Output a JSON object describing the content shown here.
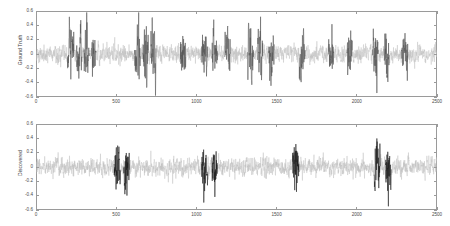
{
  "figure": {
    "background_color": "#ffffff",
    "axis_color": "#9a9a9a",
    "noise_color": "#bfbfbf",
    "highlight_color_top": "#555555",
    "highlight_color_bottom": "#1a1a1a"
  },
  "chart_data": [
    {
      "type": "line",
      "title": "",
      "subplot_index": 0,
      "xlabel": "",
      "ylabel": "Ground Truth",
      "xlim": [
        0,
        2500
      ],
      "ylim": [
        -0.6,
        0.6
      ],
      "grid": false,
      "legend": null,
      "xticks": [
        0,
        500,
        1000,
        1500,
        2000,
        2500
      ],
      "xticklabels": [
        "0",
        "500",
        "1000",
        "1500",
        "2000",
        "2500"
      ],
      "yticks": [
        -0.6,
        -0.4,
        -0.2,
        0,
        0.2,
        0.4,
        0.6
      ],
      "yticklabels": [
        "-0.6",
        "-0.4",
        "-0.2",
        "0",
        "0.2",
        "0.4",
        "0.6"
      ],
      "series": [
        {
          "name": "background noise",
          "color": "#bfbfbf",
          "description": "Light gray dense zero-mean noisy signal spanning the full x range, amplitude roughly +/-0.25",
          "noise_amplitude": 0.22,
          "n_points": 2500,
          "seed": 1337
        },
        {
          "name": "highlighted bursts",
          "color": "#555555",
          "description": "Dark gray high-amplitude burst segments overlaid on the noise, amplitude roughly +/-0.5",
          "burst_amplitude": 0.5,
          "bursts": [
            [
              196,
              238
            ],
            [
              252,
              286
            ],
            [
              300,
              332
            ],
            [
              346,
              374
            ],
            [
              614,
              652
            ],
            [
              666,
              700
            ],
            [
              716,
              748
            ],
            [
              900,
              934
            ],
            [
              1034,
              1070
            ],
            [
              1098,
              1132
            ],
            [
              1178,
              1212
            ],
            [
              1320,
              1356
            ],
            [
              1382,
              1414
            ],
            [
              1452,
              1486
            ],
            [
              1642,
              1678
            ],
            [
              1824,
              1856
            ],
            [
              1940,
              1972
            ],
            [
              2100,
              2134
            ],
            [
              2170,
              2202
            ],
            [
              2280,
              2318
            ]
          ]
        }
      ]
    },
    {
      "type": "line",
      "title": "",
      "subplot_index": 1,
      "xlabel": "",
      "ylabel": "Discovered",
      "xlim": [
        0,
        2500
      ],
      "ylim": [
        -0.6,
        0.6
      ],
      "grid": false,
      "legend": null,
      "xticks": [
        0,
        500,
        1000,
        1500,
        2000,
        2500
      ],
      "xticklabels": [
        "0",
        "500",
        "1000",
        "1500",
        "2000",
        "2500"
      ],
      "yticks": [
        -0.6,
        -0.4,
        -0.2,
        0,
        0.2,
        0.4,
        0.6
      ],
      "yticklabels": [
        "-0.6",
        "-0.4",
        "-0.2",
        "0",
        "0.2",
        "0.4",
        "0.6"
      ],
      "series": [
        {
          "name": "background noise",
          "color": "#bfbfbf",
          "description": "Light gray dense zero-mean noisy signal spanning the full x range, amplitude roughly +/-0.25",
          "noise_amplitude": 0.22,
          "n_points": 2500,
          "seed": 24601
        },
        {
          "name": "highlighted bursts",
          "color": "#1a1a1a",
          "description": "Black high-amplitude burst segments, fewer than in the Ground Truth subplot",
          "burst_amplitude": 0.5,
          "bursts": [
            [
              488,
              526
            ],
            [
              548,
              582
            ],
            [
              1034,
              1070
            ],
            [
              1098,
              1130
            ],
            [
              1600,
              1640
            ],
            [
              2110,
              2146
            ],
            [
              2180,
              2214
            ]
          ]
        }
      ]
    }
  ]
}
